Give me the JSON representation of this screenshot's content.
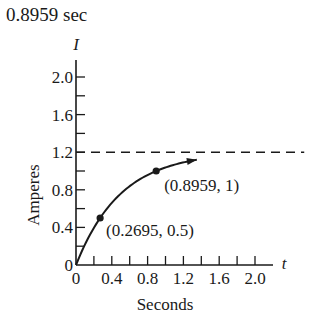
{
  "header": {
    "title": "0.8959 sec"
  },
  "chart_data": {
    "type": "line",
    "title": "0.8959 sec",
    "xlabel": "Seconds",
    "ylabel": "Amperes",
    "x_axis_symbol": "t",
    "y_axis_symbol": "I",
    "xlim": [
      0,
      2.2
    ],
    "ylim": [
      0,
      2.2
    ],
    "x_ticks": [
      0,
      0.2,
      0.4,
      0.6,
      0.8,
      1.0,
      1.2,
      1.4,
      1.6,
      1.8,
      2.0
    ],
    "x_tick_labels": [
      "0",
      "0.4",
      "0.8",
      "1.2",
      "1.6",
      "2.0"
    ],
    "x_tick_label_values": [
      0,
      0.4,
      0.8,
      1.2,
      1.6,
      2.0
    ],
    "y_ticks": [
      0,
      0.2,
      0.4,
      0.6,
      0.8,
      1.0,
      1.2,
      1.4,
      1.6,
      1.8,
      2.0
    ],
    "y_tick_labels": [
      "0",
      "0.4",
      "0.8",
      "1.2",
      "1.6",
      "2.0"
    ],
    "y_tick_label_values": [
      0,
      0.4,
      0.8,
      1.2,
      1.6,
      2.0
    ],
    "grid": false,
    "series": [
      {
        "name": "I(t)",
        "formula": "I = 1.2(1 - e^(-2t))",
        "x": [
          0,
          0.1,
          0.2,
          0.2695,
          0.4,
          0.5,
          0.6,
          0.7,
          0.8,
          0.8959,
          1.0,
          1.1,
          1.2,
          1.35
        ],
        "y": [
          0,
          0.218,
          0.396,
          0.5,
          0.661,
          0.759,
          0.839,
          0.904,
          0.958,
          1.0,
          1.038,
          1.067,
          1.091,
          1.119
        ],
        "style": "solid",
        "end_marker": "arrow"
      },
      {
        "name": "asymptote",
        "x": [
          0,
          2.55
        ],
        "y": [
          1.2,
          1.2
        ],
        "style": "dashed"
      }
    ],
    "annotations": [
      {
        "x": 0.2695,
        "y": 0.5,
        "label": "(0.2695, 0.5)",
        "marker": "dot"
      },
      {
        "x": 0.8959,
        "y": 1,
        "label": "(0.8959, 1)",
        "marker": "dot"
      }
    ]
  }
}
